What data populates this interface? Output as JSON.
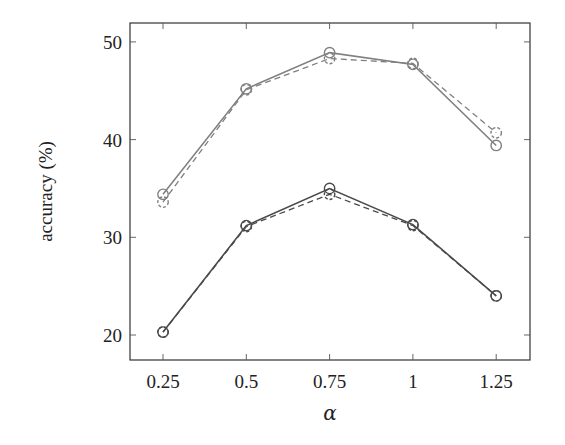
{
  "chart_data": {
    "type": "line",
    "title": "",
    "xlabel": "α",
    "ylabel": "accuracy (%)",
    "x": [
      0.25,
      0.5,
      0.75,
      1,
      1.25
    ],
    "x_tick_labels": [
      "0.25",
      "0.5",
      "0.75",
      "1",
      "1.25"
    ],
    "y_ticks": [
      20,
      30,
      40,
      50
    ],
    "y_tick_labels": [
      "20",
      "30",
      "40",
      "50"
    ],
    "xlim": [
      0.15,
      1.38
    ],
    "ylim": [
      17.4,
      51.9
    ],
    "grid": false,
    "legend": null,
    "series": [
      {
        "name": "upper-solid",
        "style": "solid",
        "marker": "circle",
        "color": "#808080",
        "values": [
          34.4,
          45.2,
          48.9,
          47.7,
          39.4
        ]
      },
      {
        "name": "upper-dashed",
        "style": "dashed",
        "marker": "circle",
        "color": "#808080",
        "values": [
          33.6,
          45.1,
          48.3,
          47.8,
          40.7
        ]
      },
      {
        "name": "lower-solid",
        "style": "solid",
        "marker": "circle",
        "color": "#4a4a4a",
        "values": [
          20.3,
          31.2,
          35.0,
          31.3,
          24.0
        ]
      },
      {
        "name": "lower-dashed",
        "style": "dashed",
        "marker": "circle",
        "color": "#4a4a4a",
        "values": [
          20.3,
          31.1,
          34.4,
          31.2,
          24.0
        ]
      }
    ]
  },
  "layout": {
    "frame": {
      "left": 130,
      "top": 23,
      "right": 530,
      "bottom": 360
    },
    "x_pixel_per_unit": 333.2,
    "x_origin_value": 0.25,
    "x_origin_pixel": 163,
    "y_origin_value": 20,
    "y_origin_pixel": 335,
    "y_pixel_per_unit": 9.77
  }
}
